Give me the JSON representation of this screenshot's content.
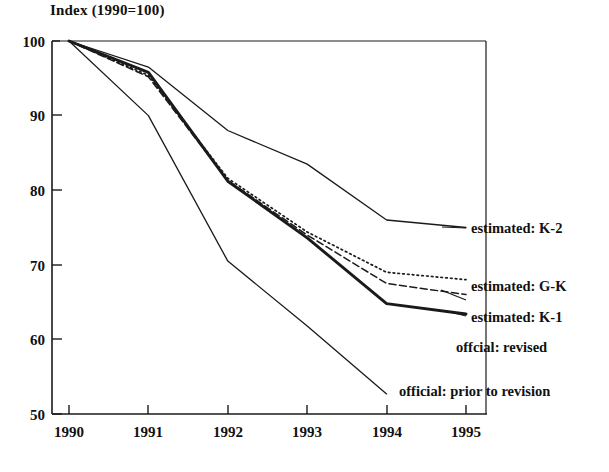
{
  "chart": {
    "title": "Index (1990=100)",
    "axis": {
      "x_ticks": [
        "1990",
        "1991",
        "1992",
        "1993",
        "1994",
        "1995"
      ],
      "y_ticks": [
        "100",
        "90",
        "80",
        "70",
        "60",
        "50"
      ]
    }
  },
  "labels": {
    "k2": "estimated: K-2",
    "gk": "estimated: G-K",
    "k1": "estimated:  K-1",
    "official_revised": "offcial: revised",
    "official_prior": "official: prior to revision"
  },
  "colors": {
    "axis": "#1a1a1a",
    "line": "#1a1a1a",
    "background": "#ffffff"
  },
  "chart_data": {
    "type": "line",
    "title": "Index (1990=100)",
    "xlabel": "",
    "ylabel": "Index (1990=100)",
    "x": [
      1990,
      1991,
      1992,
      1993,
      1994,
      1995
    ],
    "xlim": [
      1990,
      1995
    ],
    "ylim": [
      50,
      100
    ],
    "xtick_labels": [
      "1990",
      "1991",
      "1992",
      "1993",
      "1994",
      "1995"
    ],
    "ytick_labels": [
      "100",
      "90",
      "80",
      "70",
      "60",
      "50"
    ],
    "grid": false,
    "legend": "inline-right-annotations",
    "series": [
      {
        "name": "estimated: K-2",
        "style": "solid-thin",
        "values": [
          100,
          96.5,
          88.0,
          83.5,
          76.0,
          75.0
        ]
      },
      {
        "name": "estimated: G-K",
        "style": "dotted",
        "values": [
          100,
          95.4,
          81.6,
          74.4,
          69.0,
          68.0
        ]
      },
      {
        "name": "estimated:  K-1",
        "style": "dashed",
        "values": [
          100,
          95.2,
          81.3,
          74.0,
          67.5,
          66.0
        ]
      },
      {
        "name": "offcial: revised",
        "style": "solid-thick",
        "values": [
          100,
          95.8,
          81.2,
          73.6,
          64.8,
          63.4
        ]
      },
      {
        "name": "official: prior to revision",
        "style": "solid-thin",
        "values": [
          100,
          90.0,
          70.5,
          61.8,
          52.7,
          null
        ]
      }
    ]
  }
}
